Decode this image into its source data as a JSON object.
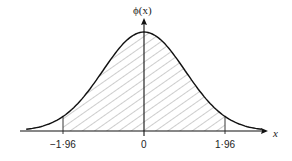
{
  "chart_data": {
    "type": "area",
    "title": "",
    "xlabel": "x",
    "ylabel": "ϕ(x)",
    "x_ticks": [
      "−1·96",
      "0",
      "1·96"
    ],
    "x_tick_values": [
      -1.96,
      0,
      1.96
    ],
    "shaded_region": {
      "from": -1.96,
      "to": 1.96,
      "style": "diagonal hatch"
    },
    "x_range": [
      -3.2,
      3.2
    ],
    "grid": false,
    "legend": null,
    "curve": "standard normal pdf"
  },
  "labels": {
    "y_axis": "ϕ(x)",
    "x_axis": "x",
    "tick_neg": "−1·96",
    "tick_zero": "0",
    "tick_pos": "1·96"
  }
}
